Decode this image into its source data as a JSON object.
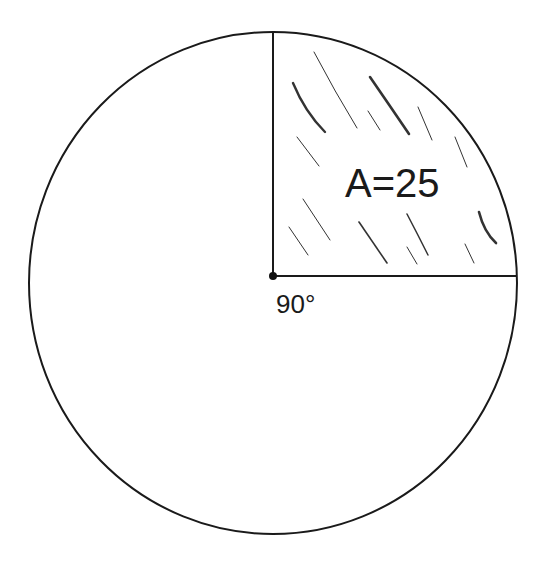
{
  "diagram": {
    "type": "circle-sector",
    "circle": {
      "cx": 273,
      "cy": 283,
      "rx": 244,
      "ry": 251,
      "stroke": "#1a1a1a"
    },
    "center": {
      "x": 273,
      "y": 276
    },
    "radius_top_end": {
      "x": 273,
      "y": 33
    },
    "radius_right_end": {
      "x": 517,
      "y": 276
    },
    "sector": {
      "angle_label": "90°",
      "area_label": "A=25",
      "shading": "hatched"
    },
    "colors": {
      "line": "#1a1a1a",
      "hatch": "#333333",
      "background": "#ffffff"
    }
  }
}
